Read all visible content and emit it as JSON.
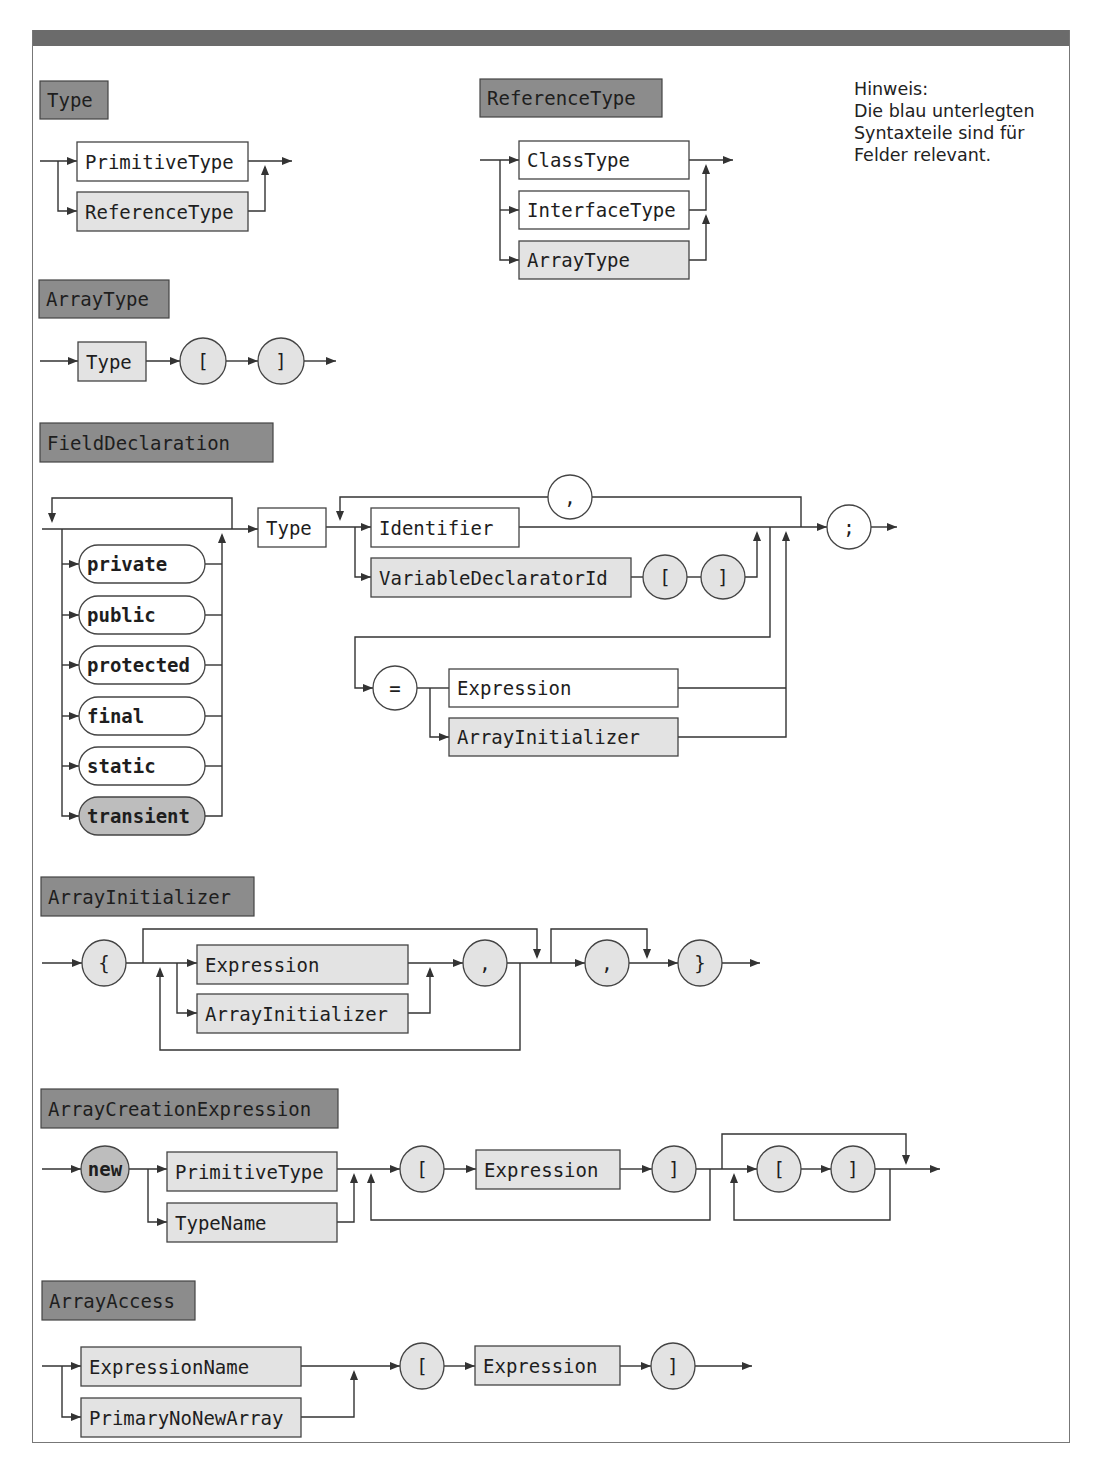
{
  "colors": {
    "header_fill": "#8c8c8c",
    "highlight_fill": "#e3e3e3",
    "plain_fill": "#ffffff",
    "keyword_highlight_fill": "#bdbdbd",
    "line": "#333333",
    "frame": "#777777",
    "topbar": "#6b6b6b"
  },
  "note": {
    "lines": [
      "Hinweis:",
      "Die blau unterlegten",
      "Syntaxteile sind für",
      "Felder relevant."
    ]
  },
  "sections": [
    {
      "id": "type",
      "title": "Type",
      "title_box": [
        40,
        81,
        68,
        38
      ],
      "nodes": [
        {
          "kind": "box",
          "label": "PrimitiveType",
          "x": 77,
          "y": 142,
          "w": 171,
          "h": 39,
          "fill": "plain"
        },
        {
          "kind": "box",
          "label": "ReferenceType",
          "x": 77,
          "y": 192,
          "w": 171,
          "h": 39,
          "fill": "highlight"
        }
      ],
      "paths": [
        "M40,161 L77,161",
        "M58,161 L58,211 L77,211",
        "M248,161 L292,161",
        "M248,211 L265,211 L265,167"
      ],
      "arrows": [
        [
          77,
          161,
          "r"
        ],
        [
          77,
          211,
          "r"
        ],
        [
          292,
          161,
          "r"
        ],
        [
          265,
          165,
          "u"
        ]
      ]
    },
    {
      "id": "reference-type",
      "title": "ReferenceType",
      "title_box": [
        480,
        79,
        182,
        38
      ],
      "nodes": [
        {
          "kind": "box",
          "label": "ClassType",
          "x": 519,
          "y": 141,
          "w": 170,
          "h": 38,
          "fill": "plain"
        },
        {
          "kind": "box",
          "label": "InterfaceType",
          "x": 519,
          "y": 191,
          "w": 170,
          "h": 38,
          "fill": "plain"
        },
        {
          "kind": "box",
          "label": "ArrayType",
          "x": 519,
          "y": 241,
          "w": 170,
          "h": 38,
          "fill": "highlight"
        }
      ],
      "paths": [
        "M480,160 L519,160",
        "M500,160 L500,260 L519,260",
        "M500,210 L519,210",
        "M689,160 L733,160",
        "M689,210 L706,210 L706,166",
        "M689,260 L706,260 L706,216"
      ],
      "arrows": [
        [
          519,
          160,
          "r"
        ],
        [
          519,
          210,
          "r"
        ],
        [
          519,
          260,
          "r"
        ],
        [
          733,
          160,
          "r"
        ],
        [
          706,
          164,
          "u"
        ],
        [
          706,
          214,
          "u"
        ]
      ]
    },
    {
      "id": "array-type",
      "title": "ArrayType",
      "title_box": [
        39,
        280,
        130,
        38
      ],
      "nodes": [
        {
          "kind": "box",
          "label": "Type",
          "x": 78,
          "y": 342,
          "w": 68,
          "h": 39,
          "fill": "highlight"
        },
        {
          "kind": "circle",
          "label": "[",
          "cx": 203,
          "cy": 361,
          "rx": 23,
          "ry": 23,
          "fill": "highlight"
        },
        {
          "kind": "circle",
          "label": "]",
          "cx": 281,
          "cy": 361,
          "rx": 23,
          "ry": 23,
          "fill": "highlight"
        }
      ],
      "paths": [
        "M40,361 L78,361",
        "M146,361 L180,361",
        "M226,361 L258,361",
        "M304,361 L336,361"
      ],
      "arrows": [
        [
          78,
          361,
          "r"
        ],
        [
          180,
          361,
          "r"
        ],
        [
          258,
          361,
          "r"
        ],
        [
          336,
          361,
          "r"
        ]
      ]
    },
    {
      "id": "field-declaration",
      "title": "FieldDeclaration",
      "title_box": [
        40,
        423,
        233,
        39
      ],
      "nodes": [
        {
          "kind": "pill",
          "label": "private",
          "x": 79,
          "y": 545,
          "w": 126,
          "h": 38,
          "fill": "plain",
          "bold": true
        },
        {
          "kind": "pill",
          "label": "public",
          "x": 79,
          "y": 596,
          "w": 126,
          "h": 38,
          "fill": "plain",
          "bold": true
        },
        {
          "kind": "pill",
          "label": "protected",
          "x": 79,
          "y": 646,
          "w": 126,
          "h": 38,
          "fill": "plain",
          "bold": true
        },
        {
          "kind": "pill",
          "label": "final",
          "x": 79,
          "y": 697,
          "w": 126,
          "h": 38,
          "fill": "plain",
          "bold": true
        },
        {
          "kind": "pill",
          "label": "static",
          "x": 79,
          "y": 747,
          "w": 126,
          "h": 38,
          "fill": "plain",
          "bold": true
        },
        {
          "kind": "pill",
          "label": "transient",
          "x": 79,
          "y": 797,
          "w": 126,
          "h": 38,
          "fill": "keyword_highlight",
          "bold": true
        },
        {
          "kind": "box",
          "label": "Type",
          "x": 258,
          "y": 508,
          "w": 68,
          "h": 39,
          "fill": "plain"
        },
        {
          "kind": "box",
          "label": "Identifier",
          "x": 371,
          "y": 508,
          "w": 148,
          "h": 39,
          "fill": "plain"
        },
        {
          "kind": "box",
          "label": "VariableDeclaratorId",
          "x": 371,
          "y": 558,
          "w": 260,
          "h": 39,
          "fill": "highlight"
        },
        {
          "kind": "circle",
          "label": "[",
          "cx": 665,
          "cy": 577,
          "rx": 22,
          "ry": 22,
          "fill": "highlight"
        },
        {
          "kind": "circle",
          "label": "]",
          "cx": 723,
          "cy": 577,
          "rx": 22,
          "ry": 22,
          "fill": "highlight"
        },
        {
          "kind": "circle",
          "label": ",",
          "cx": 570,
          "cy": 497,
          "rx": 22,
          "ry": 22,
          "fill": "plain"
        },
        {
          "kind": "circle",
          "label": ";",
          "cx": 849,
          "cy": 527,
          "rx": 22,
          "ry": 22,
          "fill": "plain"
        },
        {
          "kind": "circle",
          "label": "=",
          "cx": 395,
          "cy": 688,
          "rx": 22,
          "ry": 22,
          "fill": "plain"
        },
        {
          "kind": "box",
          "label": "Expression",
          "x": 449,
          "y": 669,
          "w": 229,
          "h": 38,
          "fill": "plain"
        },
        {
          "kind": "box",
          "label": "ArrayInitializer",
          "x": 449,
          "y": 718,
          "w": 229,
          "h": 38,
          "fill": "highlight"
        }
      ],
      "paths": [
        "M42,529 L258,529",
        "M232,529 L232,498 L52,498 L52,521",
        "M62,529 L62,816 L79,816",
        "M62,564 L79,564",
        "M62,615 L79,615",
        "M62,665 L79,665",
        "M62,716 L79,716",
        "M62,766 L79,766",
        "M205,564 L222,564",
        "M205,615 L222,615",
        "M205,665 L222,665",
        "M205,716 L222,716",
        "M205,766 L222,766",
        "M205,816 L222,816 L222,535",
        "M326,527 L371,527",
        "M355,527 L355,577 L371,577",
        "M548,497 L340,497 L340,519",
        "M592,497 L801,497 L801,527",
        "M519,527 L827,527",
        "M631,577 L643,577",
        "M687,577 L701,577",
        "M745,577 L757,577 L757,533",
        "M770,527 L770,637 L355,637 L355,688 L373,688",
        "M417,688 L449,688",
        "M430,688 L430,737 L449,737",
        "M678,688 L786,688",
        "M678,737 L786,737 L786,533",
        "M871,527 L897,527"
      ],
      "arrows": [
        [
          52,
          523,
          "d"
        ],
        [
          79,
          564,
          "r"
        ],
        [
          79,
          615,
          "r"
        ],
        [
          79,
          665,
          "r"
        ],
        [
          79,
          716,
          "r"
        ],
        [
          79,
          766,
          "r"
        ],
        [
          79,
          816,
          "r"
        ],
        [
          222,
          533,
          "u"
        ],
        [
          258,
          529,
          "r"
        ],
        [
          340,
          521,
          "d"
        ],
        [
          371,
          527,
          "r"
        ],
        [
          371,
          577,
          "r"
        ],
        [
          757,
          531,
          "u"
        ],
        [
          786,
          531,
          "u"
        ],
        [
          827,
          527,
          "r"
        ],
        [
          373,
          688,
          "r"
        ],
        [
          449,
          737,
          "r"
        ],
        [
          897,
          527,
          "r"
        ]
      ]
    },
    {
      "id": "array-initializer",
      "title": "ArrayInitializer",
      "title_box": [
        41,
        877,
        213,
        39
      ],
      "nodes": [
        {
          "kind": "circle",
          "label": "{",
          "cx": 104,
          "cy": 963,
          "rx": 22,
          "ry": 23,
          "fill": "highlight"
        },
        {
          "kind": "box",
          "label": "Expression",
          "x": 197,
          "y": 945,
          "w": 211,
          "h": 39,
          "fill": "highlight"
        },
        {
          "kind": "box",
          "label": "ArrayInitializer",
          "x": 197,
          "y": 994,
          "w": 211,
          "h": 39,
          "fill": "highlight"
        },
        {
          "kind": "circle",
          "label": ",",
          "cx": 485,
          "cy": 963,
          "rx": 22,
          "ry": 23,
          "fill": "highlight"
        },
        {
          "kind": "circle",
          "label": ",",
          "cx": 607,
          "cy": 963,
          "rx": 22,
          "ry": 23,
          "fill": "highlight"
        },
        {
          "kind": "circle",
          "label": "}",
          "cx": 700,
          "cy": 963,
          "rx": 22,
          "ry": 23,
          "fill": "highlight"
        }
      ],
      "paths": [
        "M42,963 L82,963",
        "M126,963 L197,963",
        "M177,963 L177,1013 L197,1013",
        "M143,963 L143,929 L537,929 L537,957",
        "M408,963 L463,963",
        "M408,1013 L430,1013 L430,969",
        "M507,963 L585,963",
        "M520,963 L520,1050 L160,1050 L160,969",
        "M551,963 L551,929 L647,929 L647,957",
        "M629,963 L678,963",
        "M722,963 L760,963"
      ],
      "arrows": [
        [
          82,
          963,
          "r"
        ],
        [
          197,
          963,
          "r"
        ],
        [
          197,
          1013,
          "r"
        ],
        [
          537,
          959,
          "d"
        ],
        [
          430,
          967,
          "u"
        ],
        [
          463,
          963,
          "r"
        ],
        [
          160,
          967,
          "u"
        ],
        [
          585,
          963,
          "r"
        ],
        [
          647,
          959,
          "d"
        ],
        [
          678,
          963,
          "r"
        ],
        [
          760,
          963,
          "r"
        ]
      ]
    },
    {
      "id": "array-creation-expression",
      "title": "ArrayCreationExpression",
      "title_box": [
        41,
        1089,
        297,
        39
      ],
      "nodes": [
        {
          "kind": "circle",
          "label": "new",
          "cx": 105,
          "cy": 1169,
          "rx": 24,
          "ry": 23,
          "fill": "keyword_highlight",
          "bold": true
        },
        {
          "kind": "box",
          "label": "PrimitiveType",
          "x": 167,
          "y": 1152,
          "w": 170,
          "h": 39,
          "fill": "highlight"
        },
        {
          "kind": "box",
          "label": "TypeName",
          "x": 167,
          "y": 1203,
          "w": 170,
          "h": 39,
          "fill": "highlight"
        },
        {
          "kind": "circle",
          "label": "[",
          "cx": 422,
          "cy": 1169,
          "rx": 22,
          "ry": 23,
          "fill": "highlight"
        },
        {
          "kind": "box",
          "label": "Expression",
          "x": 476,
          "y": 1150,
          "w": 144,
          "h": 39,
          "fill": "highlight"
        },
        {
          "kind": "circle",
          "label": "]",
          "cx": 674,
          "cy": 1169,
          "rx": 22,
          "ry": 23,
          "fill": "highlight"
        },
        {
          "kind": "circle",
          "label": "[",
          "cx": 779,
          "cy": 1169,
          "rx": 22,
          "ry": 23,
          "fill": "highlight"
        },
        {
          "kind": "circle",
          "label": "]",
          "cx": 853,
          "cy": 1169,
          "rx": 22,
          "ry": 23,
          "fill": "highlight"
        }
      ],
      "paths": [
        "M42,1169 L81,1169",
        "M129,1169 L167,1169",
        "M148,1169 L148,1222 L167,1222",
        "M337,1169 L400,1169",
        "M337,1222 L354,1222 L354,1175",
        "M444,1169 L476,1169",
        "M620,1169 L652,1169",
        "M696,1169 L757,1169",
        "M710,1169 L710,1220 L371,1220 L371,1175",
        "M722,1169 L722,1134 L906,1134 L906,1163",
        "M801,1169 L831,1169",
        "M875,1169 L940,1169",
        "M890,1169 L890,1220 L734,1220 L734,1175"
      ],
      "arrows": [
        [
          81,
          1169,
          "r"
        ],
        [
          167,
          1169,
          "r"
        ],
        [
          167,
          1222,
          "r"
        ],
        [
          354,
          1173,
          "u"
        ],
        [
          400,
          1169,
          "r"
        ],
        [
          371,
          1173,
          "u"
        ],
        [
          476,
          1169,
          "r"
        ],
        [
          652,
          1169,
          "r"
        ],
        [
          757,
          1169,
          "r"
        ],
        [
          906,
          1165,
          "d"
        ],
        [
          734,
          1173,
          "u"
        ],
        [
          831,
          1169,
          "r"
        ],
        [
          940,
          1169,
          "r"
        ]
      ]
    },
    {
      "id": "array-access",
      "title": "ArrayAccess",
      "title_box": [
        42,
        1281,
        153,
        39
      ],
      "nodes": [
        {
          "kind": "box",
          "label": "ExpressionName",
          "x": 81,
          "y": 1347,
          "w": 220,
          "h": 39,
          "fill": "highlight"
        },
        {
          "kind": "box",
          "label": "PrimaryNoNewArray",
          "x": 81,
          "y": 1398,
          "w": 220,
          "h": 39,
          "fill": "highlight"
        },
        {
          "kind": "circle",
          "label": "[",
          "cx": 422,
          "cy": 1366,
          "rx": 22,
          "ry": 23,
          "fill": "highlight"
        },
        {
          "kind": "box",
          "label": "Expression",
          "x": 475,
          "y": 1346,
          "w": 145,
          "h": 39,
          "fill": "highlight"
        },
        {
          "kind": "circle",
          "label": "]",
          "cx": 673,
          "cy": 1366,
          "rx": 22,
          "ry": 23,
          "fill": "highlight"
        }
      ],
      "paths": [
        "M42,1366 L81,1366",
        "M62,1366 L62,1417 L81,1417",
        "M301,1366 L400,1366",
        "M301,1417 L354,1417 L354,1372",
        "M444,1366 L475,1366",
        "M620,1366 L651,1366",
        "M695,1366 L752,1366"
      ],
      "arrows": [
        [
          81,
          1366,
          "r"
        ],
        [
          81,
          1417,
          "r"
        ],
        [
          354,
          1370,
          "u"
        ],
        [
          400,
          1366,
          "r"
        ],
        [
          475,
          1366,
          "r"
        ],
        [
          651,
          1366,
          "r"
        ],
        [
          752,
          1366,
          "r"
        ]
      ]
    }
  ]
}
